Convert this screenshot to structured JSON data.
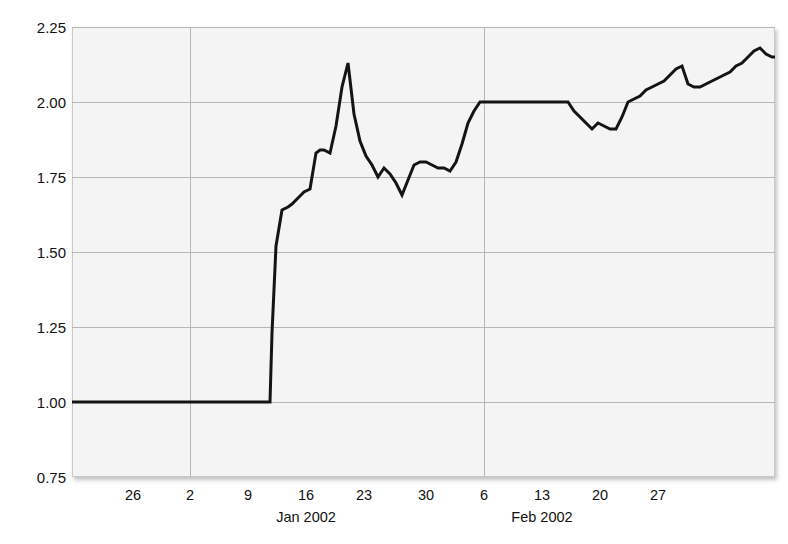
{
  "chart_data": {
    "type": "line",
    "title": "",
    "xlabel": "",
    "ylabel": "",
    "ylim": [
      0.75,
      2.25
    ],
    "yticks": [
      "0.75",
      "1.00",
      "1.25",
      "1.50",
      "1.75",
      "2.00",
      "2.25"
    ],
    "ytick_values": [
      0.75,
      1.0,
      1.25,
      1.5,
      1.75,
      2.0,
      2.25
    ],
    "xticks": [
      "26",
      "2",
      "9",
      "16",
      "23",
      "30",
      "6",
      "13",
      "20",
      "27"
    ],
    "xtick_positions": [
      133,
      190,
      248,
      306,
      364,
      426,
      484,
      542,
      600,
      658
    ],
    "xgroups": [
      {
        "label": "Jan 2002",
        "position": 306
      },
      {
        "label": "Feb 2002",
        "position": 542
      }
    ],
    "month_gridlines": [
      190,
      484
    ],
    "grid": true,
    "legend": "none",
    "line_color": "#141414",
    "plot_background": "#f4f4f4",
    "grid_color": "#b6b6b6",
    "series": [
      {
        "name": "series-1",
        "x": [
          72,
          100,
          130,
          160,
          190,
          220,
          248,
          262,
          268,
          270,
          272,
          276,
          282,
          288,
          292,
          298,
          304,
          310,
          316,
          320,
          324,
          330,
          336,
          342,
          348,
          354,
          360,
          366,
          372,
          378,
          384,
          390,
          396,
          402,
          408,
          414,
          420,
          426,
          432,
          438,
          444,
          450,
          456,
          462,
          468,
          474,
          480,
          486,
          492,
          498,
          508,
          520,
          532,
          544,
          556,
          568,
          574,
          580,
          586,
          592,
          598,
          604,
          610,
          616,
          622,
          628,
          634,
          640,
          646,
          652,
          658,
          664,
          670,
          676,
          682,
          688,
          694,
          700,
          706,
          712,
          718,
          724,
          730,
          736,
          742,
          748,
          754,
          760,
          766,
          772,
          775
        ],
        "y": [
          1.0,
          1.0,
          1.0,
          1.0,
          1.0,
          1.0,
          1.0,
          1.0,
          1.0,
          1.0,
          1.23,
          1.52,
          1.64,
          1.65,
          1.66,
          1.68,
          1.7,
          1.71,
          1.83,
          1.84,
          1.84,
          1.83,
          1.92,
          2.05,
          2.13,
          1.96,
          1.87,
          1.82,
          1.79,
          1.75,
          1.78,
          1.76,
          1.73,
          1.69,
          1.74,
          1.79,
          1.8,
          1.8,
          1.79,
          1.78,
          1.78,
          1.77,
          1.8,
          1.86,
          1.93,
          1.97,
          2.0,
          2.0,
          2.0,
          2.0,
          2.0,
          2.0,
          2.0,
          2.0,
          2.0,
          2.0,
          1.97,
          1.95,
          1.93,
          1.91,
          1.93,
          1.92,
          1.91,
          1.91,
          1.95,
          2.0,
          2.01,
          2.02,
          2.04,
          2.05,
          2.06,
          2.07,
          2.09,
          2.11,
          2.12,
          2.06,
          2.05,
          2.05,
          2.06,
          2.07,
          2.08,
          2.09,
          2.1,
          2.12,
          2.13,
          2.15,
          2.17,
          2.18,
          2.16,
          2.15,
          2.15
        ]
      }
    ]
  }
}
